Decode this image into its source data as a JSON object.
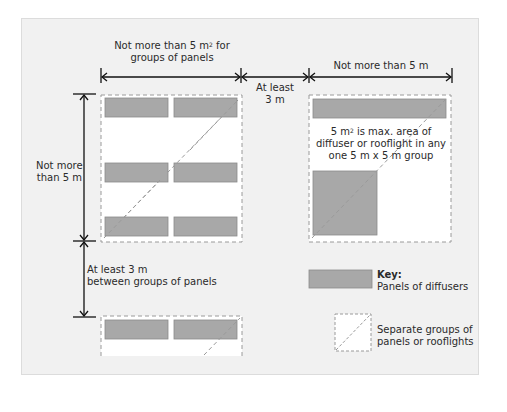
{
  "diagram": {
    "type": "dimensioned layout diagram",
    "colors": {
      "background": "#f1f1f1",
      "group_fill": "#ffffff",
      "panel_fill": "#a8a8a8",
      "panel_border": "#8a8a8a",
      "dashed_line": "#9a9a9a",
      "dimension_line": "#111111",
      "text": "#2a2a2a"
    },
    "labels": {
      "top_left_line1": "Not more than 5 m",
      "top_left_sup": "2",
      "top_left_line1_suffix": " for",
      "top_left_line2": "groups of panels",
      "top_middle_line1": "At least",
      "top_middle_line2": "3 m",
      "top_right": "Not more than 5 m",
      "left_upper_line1": "Not more",
      "left_upper_line2": "than 5 m",
      "left_lower_line1": "At least 3 m",
      "left_lower_line2": "between groups of panels",
      "right_note_line1_pre": "5 m",
      "right_note_sup": "2",
      "right_note_line1_post": " is max. area of",
      "right_note_line2": "diffuser or rooflight in any",
      "right_note_line3": "one 5 m x 5 m group"
    },
    "key": {
      "title": "Key:",
      "items": [
        {
          "symbol": "grey-panel",
          "label": "Panels of diffusers"
        },
        {
          "symbol": "dashed-square-with-diagonal",
          "label_line1": "Separate groups of",
          "label_line2": "panels or rooflights"
        }
      ]
    },
    "nodes": [
      {
        "id": "group-left-upper",
        "panels": 6
      },
      {
        "id": "group-left-lower",
        "panels": 2
      },
      {
        "id": "group-right",
        "panels": 2
      }
    ],
    "dimensions": [
      {
        "from": "group-left-upper.left",
        "to": "group-left-upper.right",
        "label": "Not more than 5 m2 for groups of panels"
      },
      {
        "from": "group-left-upper.right",
        "to": "group-right.left",
        "label": "At least 3 m"
      },
      {
        "from": "group-right.left",
        "to": "group-right.right",
        "label": "Not more than 5 m"
      },
      {
        "from": "group-left-upper.top",
        "to": "group-left-upper.bottom",
        "label": "Not more than 5 m"
      },
      {
        "from": "group-left-upper.bottom",
        "to": "group-left-lower.top",
        "label": "At least 3 m between groups of panels"
      }
    ]
  }
}
